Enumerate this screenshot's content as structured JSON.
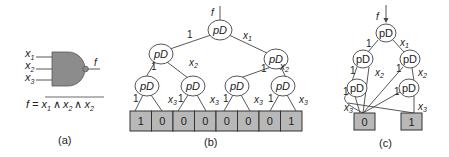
{
  "panels": {
    "a": {
      "caption": "(a)",
      "gate": {
        "type": "NAND",
        "fill": "#8c8c8c"
      },
      "inputs": [
        "x",
        "x",
        "x"
      ],
      "input_subs": [
        "1",
        "2",
        "3"
      ],
      "output": "f",
      "equation": {
        "lhs": "f = ",
        "terms": [
          "x",
          "x",
          "x"
        ],
        "subs": [
          "1",
          "2",
          "2"
        ],
        "op": "∧"
      }
    },
    "b": {
      "caption": "(b)",
      "root_label": "f",
      "node_label": "pD",
      "edge_labels": {
        "one": "1",
        "x1": "x",
        "x1_sub": "1",
        "x2": "x",
        "x2_sub": "2",
        "x3": "x",
        "x3_sub": "3"
      },
      "cells": [
        "1",
        "0",
        "0",
        "0",
        "0",
        "0",
        "0",
        "1"
      ]
    },
    "c": {
      "caption": "(c)",
      "root_label": "f",
      "node_label": "pD",
      "terminals": [
        "0",
        "1"
      ]
    }
  },
  "colors": {
    "gate": "#8c8c8c",
    "cell": "#b8b8b8",
    "line": "#444444"
  }
}
